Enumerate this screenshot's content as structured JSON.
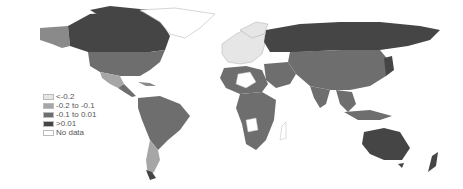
{
  "map": {
    "type": "choropleth world map",
    "colors": {
      "lt_neg02": "#e6e6e6",
      "neg02_to_neg01": "#a6a6a6",
      "neg01_to_001": "#6e6e6e",
      "gt_001": "#454545",
      "no_data": "#ffffff",
      "border": "#ffffff"
    }
  },
  "legend": {
    "items": [
      {
        "label": "<-0.2",
        "color": "#e6e6e6"
      },
      {
        "label": "-0.2 to -0.1",
        "color": "#a6a6a6"
      },
      {
        "label": "-0.1 to 0.01",
        "color": "#6e6e6e"
      },
      {
        "label": ">0.01",
        "color": "#454545"
      },
      {
        "label": "No data",
        "color": "#ffffff"
      }
    ]
  }
}
